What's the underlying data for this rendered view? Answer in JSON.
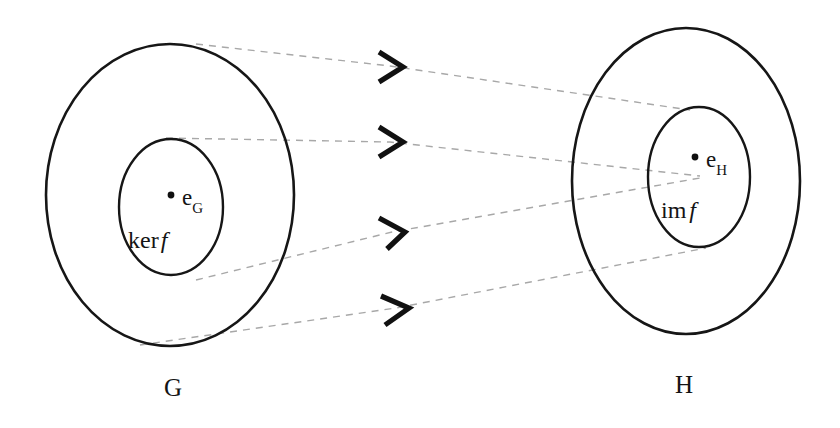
{
  "diagram": {
    "background_color": "#ffffff",
    "stroke_color": "#161616",
    "dashed_color": "#a8a8a8",
    "arrow_color": "#111111"
  },
  "domain_set": {
    "label": "G",
    "identity_label": "e",
    "identity_subscript": "G",
    "subset_prefix": "ker",
    "subset_function": "f"
  },
  "codomain_set": {
    "label": "H",
    "identity_label": "e",
    "identity_subscript": "H",
    "subset_prefix": "im",
    "subset_function": "f"
  },
  "mapping_arrows": {
    "count": 4,
    "glyph": "chevron-right",
    "style": "dashed"
  }
}
